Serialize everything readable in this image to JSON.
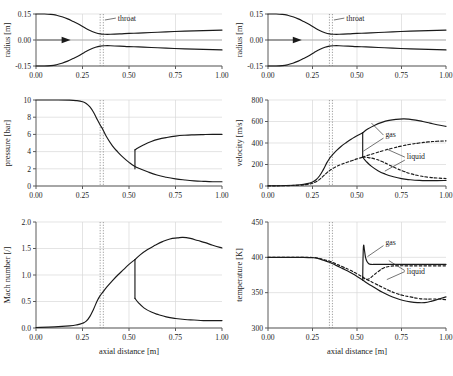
{
  "figure": {
    "xlabel": "axial distance [m]",
    "xticks": [
      "0.00",
      "0.25",
      "0.50",
      "0.75",
      "1.00"
    ],
    "xlim": [
      0.0,
      1.0
    ],
    "throat_label": "throat",
    "throat_positions": [
      0.345,
      0.362
    ],
    "legend_gas": "gas",
    "legend_liquid": "liquid",
    "line_color": "#1a1a1a",
    "grid_color": "#d9d9d9",
    "axis_color": "#5a5a5a"
  },
  "chart_data": [
    {
      "id": "radius-left",
      "type": "line",
      "title": "",
      "xlabel": "",
      "ylabel": "radius [m]",
      "xlim": [
        0.0,
        1.0
      ],
      "ylim": [
        -0.15,
        0.15
      ],
      "yticks": [
        -0.15,
        0.0,
        0.15
      ],
      "yticklabels": [
        "-0.15",
        "0.00",
        "0.15"
      ],
      "grid": true,
      "annotations": [
        {
          "text": "throat",
          "x": 0.44,
          "y": 0.112
        },
        {
          "text": "flow-arrow",
          "x": 0.1,
          "y": 0.0
        }
      ],
      "series": [
        {
          "name": "upper wall",
          "style": "solid",
          "x": [
            0.0,
            0.04,
            0.08,
            0.11,
            0.14,
            0.17,
            0.2,
            0.23,
            0.26,
            0.29,
            0.32,
            0.345,
            0.37,
            0.4,
            0.45,
            0.5,
            0.55,
            0.62,
            0.7,
            0.8,
            0.9,
            1.0
          ],
          "y": [
            0.15,
            0.15,
            0.148,
            0.143,
            0.134,
            0.122,
            0.107,
            0.091,
            0.072,
            0.055,
            0.042,
            0.035,
            0.033,
            0.033,
            0.035,
            0.038,
            0.04,
            0.043,
            0.047,
            0.051,
            0.054,
            0.057
          ]
        },
        {
          "name": "lower wall",
          "style": "solid",
          "x": [
            0.0,
            0.04,
            0.08,
            0.11,
            0.14,
            0.17,
            0.2,
            0.23,
            0.26,
            0.29,
            0.32,
            0.345,
            0.37,
            0.4,
            0.45,
            0.5,
            0.55,
            0.62,
            0.7,
            0.8,
            0.9,
            1.0
          ],
          "y": [
            -0.15,
            -0.15,
            -0.148,
            -0.143,
            -0.134,
            -0.122,
            -0.107,
            -0.091,
            -0.072,
            -0.055,
            -0.042,
            -0.035,
            -0.033,
            -0.033,
            -0.035,
            -0.038,
            -0.04,
            -0.043,
            -0.047,
            -0.051,
            -0.054,
            -0.057
          ]
        }
      ]
    },
    {
      "id": "radius-right",
      "type": "line",
      "title": "",
      "xlabel": "",
      "ylabel": "radius [m]",
      "xlim": [
        0.0,
        1.0
      ],
      "ylim": [
        -0.15,
        0.15
      ],
      "yticks": [
        -0.15,
        0.0,
        0.15
      ],
      "yticklabels": [
        "-0.15",
        "0.00",
        "0.15"
      ],
      "grid": true,
      "annotations": [
        {
          "text": "throat",
          "x": 0.44,
          "y": 0.112
        },
        {
          "text": "flow-arrow",
          "x": 0.1,
          "y": 0.0
        }
      ],
      "series": [
        {
          "name": "upper wall",
          "style": "solid",
          "x": [
            0.0,
            0.04,
            0.08,
            0.11,
            0.14,
            0.17,
            0.2,
            0.23,
            0.26,
            0.29,
            0.32,
            0.345,
            0.37,
            0.4,
            0.45,
            0.5,
            0.55,
            0.62,
            0.7,
            0.8,
            0.9,
            1.0
          ],
          "y": [
            0.15,
            0.15,
            0.148,
            0.143,
            0.134,
            0.122,
            0.107,
            0.091,
            0.072,
            0.055,
            0.042,
            0.035,
            0.033,
            0.033,
            0.035,
            0.038,
            0.04,
            0.043,
            0.047,
            0.051,
            0.054,
            0.057
          ]
        },
        {
          "name": "lower wall",
          "style": "solid",
          "x": [
            0.0,
            0.04,
            0.08,
            0.11,
            0.14,
            0.17,
            0.2,
            0.23,
            0.26,
            0.29,
            0.32,
            0.345,
            0.37,
            0.4,
            0.45,
            0.5,
            0.55,
            0.62,
            0.7,
            0.8,
            0.9,
            1.0
          ],
          "y": [
            -0.15,
            -0.15,
            -0.148,
            -0.143,
            -0.134,
            -0.122,
            -0.107,
            -0.091,
            -0.072,
            -0.055,
            -0.042,
            -0.035,
            -0.033,
            -0.033,
            -0.035,
            -0.038,
            -0.04,
            -0.043,
            -0.047,
            -0.051,
            -0.054,
            -0.057
          ]
        }
      ]
    },
    {
      "id": "pressure",
      "type": "line",
      "title": "",
      "xlabel": "",
      "ylabel": "pressure [bar]",
      "xlim": [
        0.0,
        1.0
      ],
      "ylim": [
        0,
        10
      ],
      "yticks": [
        0,
        2,
        4,
        6,
        8,
        10
      ],
      "yticklabels": [
        "0",
        "2",
        "4",
        "6",
        "8",
        "10"
      ],
      "grid": true,
      "series": [
        {
          "name": "expansion branch",
          "style": "solid",
          "x": [
            0.0,
            0.1,
            0.18,
            0.22,
            0.25,
            0.27,
            0.29,
            0.31,
            0.33,
            0.345,
            0.36,
            0.38,
            0.41,
            0.44,
            0.47,
            0.5,
            0.53,
            0.56,
            0.6,
            0.65,
            0.7,
            0.75,
            0.8,
            0.85,
            0.9,
            0.95,
            1.0
          ],
          "y": [
            10.0,
            10.0,
            9.98,
            9.92,
            9.8,
            9.6,
            9.2,
            8.55,
            7.7,
            7.1,
            6.55,
            5.7,
            4.7,
            3.95,
            3.3,
            2.75,
            2.3,
            2.0,
            1.65,
            1.28,
            1.02,
            0.83,
            0.7,
            0.6,
            0.54,
            0.5,
            0.5
          ]
        },
        {
          "name": "shock branch",
          "style": "solid",
          "x": [
            0.532,
            0.532
          ],
          "y": [
            2.0,
            4.2
          ]
        },
        {
          "name": "subsonic recovery branch",
          "style": "solid",
          "x": [
            0.532,
            0.55,
            0.58,
            0.62,
            0.66,
            0.7,
            0.75,
            0.8,
            0.85,
            0.9,
            0.95,
            1.0
          ],
          "y": [
            4.2,
            4.45,
            4.8,
            5.18,
            5.45,
            5.63,
            5.8,
            5.9,
            5.95,
            5.98,
            6.0,
            6.0
          ]
        }
      ]
    },
    {
      "id": "velocity",
      "type": "line",
      "title": "",
      "xlabel": "",
      "ylabel": "velocity [m/s]",
      "xlim": [
        0.0,
        1.0
      ],
      "ylim": [
        0,
        800
      ],
      "yticks": [
        0,
        200,
        400,
        600,
        800
      ],
      "yticklabels": [
        "0",
        "200",
        "400",
        "600",
        "800"
      ],
      "grid": true,
      "annotations": [
        {
          "text": "gas",
          "x": 0.66,
          "y": 455
        },
        {
          "text": "liquid",
          "x": 0.78,
          "y": 250
        }
      ],
      "series": [
        {
          "name": "gas accelerating branch",
          "style": "solid",
          "x": [
            0.0,
            0.1,
            0.18,
            0.22,
            0.25,
            0.27,
            0.29,
            0.31,
            0.33,
            0.345,
            0.36,
            0.38,
            0.41,
            0.44,
            0.47,
            0.5,
            0.532
          ],
          "y": [
            2,
            5,
            12,
            22,
            38,
            58,
            95,
            150,
            215,
            255,
            285,
            322,
            368,
            405,
            438,
            468,
            495
          ]
        },
        {
          "name": "gas shock drop",
          "style": "solid",
          "x": [
            0.532,
            0.532
          ],
          "y": [
            495,
            268
          ]
        },
        {
          "name": "gas post-shock branch",
          "style": "solid",
          "x": [
            0.532,
            0.55,
            0.58,
            0.62,
            0.66,
            0.7,
            0.75,
            0.8,
            0.85,
            0.9,
            0.95,
            1.0
          ],
          "y": [
            268,
            232,
            185,
            140,
            110,
            88,
            68,
            58,
            52,
            50,
            50,
            52
          ]
        },
        {
          "name": "gas supersonic branch",
          "style": "solid",
          "x": [
            0.532,
            0.56,
            0.6,
            0.64,
            0.68,
            0.72,
            0.76,
            0.79,
            0.83,
            0.87,
            0.91,
            0.95,
            1.0
          ],
          "y": [
            495,
            530,
            566,
            592,
            610,
            620,
            624,
            622,
            613,
            600,
            585,
            570,
            555
          ]
        },
        {
          "name": "liquid accelerating branch",
          "style": "dashed",
          "x": [
            0.0,
            0.1,
            0.18,
            0.22,
            0.25,
            0.27,
            0.29,
            0.31,
            0.33,
            0.345,
            0.36,
            0.38,
            0.41,
            0.44,
            0.47,
            0.5,
            0.532
          ],
          "y": [
            1,
            3,
            8,
            15,
            26,
            40,
            62,
            92,
            122,
            142,
            158,
            178,
            200,
            218,
            235,
            252,
            268
          ]
        },
        {
          "name": "liquid supersonic branch",
          "style": "dashed",
          "x": [
            0.532,
            0.56,
            0.6,
            0.65,
            0.7,
            0.75,
            0.8,
            0.85,
            0.9,
            0.95,
            1.0
          ],
          "y": [
            268,
            285,
            305,
            330,
            352,
            372,
            388,
            400,
            410,
            416,
            420
          ]
        },
        {
          "name": "liquid post-shock branch",
          "style": "dashed",
          "x": [
            0.532,
            0.56,
            0.6,
            0.64,
            0.68,
            0.72,
            0.76,
            0.8,
            0.85,
            0.9,
            0.95,
            1.0
          ],
          "y": [
            268,
            265,
            252,
            228,
            196,
            165,
            138,
            115,
            95,
            82,
            74,
            70
          ]
        }
      ]
    },
    {
      "id": "mach",
      "type": "line",
      "title": "",
      "xlabel": "axial distance [m]",
      "ylabel": "Mach number [/]",
      "xlim": [
        0.0,
        1.0
      ],
      "ylim": [
        0.0,
        2.0
      ],
      "yticks": [
        0.0,
        0.5,
        1.0,
        1.5,
        2.0
      ],
      "yticklabels": [
        "0.0",
        "0.5",
        "1.0",
        "1.5",
        "2.0"
      ],
      "grid": true,
      "series": [
        {
          "name": "accelerating branch",
          "style": "solid",
          "x": [
            0.0,
            0.1,
            0.18,
            0.22,
            0.25,
            0.27,
            0.29,
            0.31,
            0.33,
            0.345,
            0.36,
            0.38,
            0.41,
            0.44,
            0.47,
            0.5,
            0.532
          ],
          "y": [
            0.01,
            0.02,
            0.04,
            0.06,
            0.09,
            0.13,
            0.22,
            0.36,
            0.52,
            0.61,
            0.68,
            0.77,
            0.89,
            1.0,
            1.1,
            1.2,
            1.29
          ]
        },
        {
          "name": "shock drop",
          "style": "solid",
          "x": [
            0.532,
            0.532
          ],
          "y": [
            1.29,
            0.56
          ]
        },
        {
          "name": "post-shock subsonic branch",
          "style": "solid",
          "x": [
            0.532,
            0.55,
            0.58,
            0.62,
            0.66,
            0.7,
            0.75,
            0.8,
            0.85,
            0.9,
            0.95,
            1.0
          ],
          "y": [
            0.56,
            0.48,
            0.38,
            0.3,
            0.25,
            0.21,
            0.18,
            0.16,
            0.15,
            0.14,
            0.14,
            0.14
          ]
        },
        {
          "name": "supersonic branch",
          "style": "solid",
          "x": [
            0.532,
            0.56,
            0.6,
            0.64,
            0.68,
            0.72,
            0.76,
            0.79,
            0.83,
            0.87,
            0.91,
            0.95,
            1.0
          ],
          "y": [
            1.29,
            1.38,
            1.48,
            1.56,
            1.63,
            1.68,
            1.7,
            1.71,
            1.69,
            1.65,
            1.61,
            1.56,
            1.51
          ]
        }
      ]
    },
    {
      "id": "temperature",
      "type": "line",
      "title": "",
      "xlabel": "axial distance [m]",
      "ylabel": "temperature [K]",
      "xlim": [
        0.0,
        1.0
      ],
      "ylim": [
        300,
        450
      ],
      "yticks": [
        300,
        350,
        400,
        450
      ],
      "yticklabels": [
        "300",
        "350",
        "400",
        "450"
      ],
      "grid": true,
      "annotations": [
        {
          "text": "gas",
          "x": 0.66,
          "y": 418
        },
        {
          "text": "liquid",
          "x": 0.78,
          "y": 377
        }
      ],
      "series": [
        {
          "name": "gas expansion branch",
          "style": "solid",
          "x": [
            0.0,
            0.12,
            0.2,
            0.25,
            0.28,
            0.31,
            0.345,
            0.38,
            0.42,
            0.46,
            0.5,
            0.532
          ],
          "y": [
            400,
            400,
            400,
            399.5,
            398.5,
            396,
            393,
            389,
            384,
            379,
            373,
            368
          ]
        },
        {
          "name": "gas shock spike",
          "style": "solid",
          "x": [
            0.532,
            0.534,
            0.537,
            0.542,
            0.548,
            0.556,
            0.566,
            0.58,
            0.6,
            0.63,
            0.67,
            0.72,
            0.78,
            0.85,
            0.92,
            1.0
          ],
          "y": [
            368,
            400,
            417,
            410,
            400,
            394,
            391,
            390,
            390,
            390,
            390,
            390,
            390,
            390,
            390,
            390
          ]
        },
        {
          "name": "gas supersonic branch",
          "style": "solid",
          "x": [
            0.532,
            0.56,
            0.6,
            0.64,
            0.68,
            0.72,
            0.76,
            0.8,
            0.84,
            0.88,
            0.92,
            0.96,
            1.0
          ],
          "y": [
            368,
            363,
            357,
            351,
            346,
            342,
            339,
            337,
            336,
            336,
            338,
            341,
            344
          ]
        },
        {
          "name": "liquid expansion branch",
          "style": "dashed",
          "x": [
            0.0,
            0.12,
            0.2,
            0.25,
            0.28,
            0.31,
            0.345,
            0.38,
            0.42,
            0.46,
            0.5,
            0.532
          ],
          "y": [
            400,
            400,
            400,
            399.7,
            399,
            397,
            394.5,
            391,
            386.5,
            382,
            376.5,
            372
          ]
        },
        {
          "name": "liquid post-shock branch",
          "style": "dashed",
          "x": [
            0.532,
            0.55,
            0.57,
            0.59,
            0.62,
            0.65,
            0.68,
            0.72,
            0.78,
            0.85,
            0.92,
            1.0
          ],
          "y": [
            372,
            369,
            370,
            374,
            380,
            385,
            387,
            388,
            388,
            388,
            388,
            388
          ]
        },
        {
          "name": "liquid supersonic branch",
          "style": "dashed",
          "x": [
            0.532,
            0.56,
            0.6,
            0.64,
            0.68,
            0.72,
            0.76,
            0.8,
            0.84,
            0.88,
            0.92,
            0.96,
            1.0
          ],
          "y": [
            372,
            368,
            363,
            358,
            353,
            349,
            346,
            344,
            342,
            341,
            341,
            341,
            340
          ]
        }
      ]
    }
  ]
}
